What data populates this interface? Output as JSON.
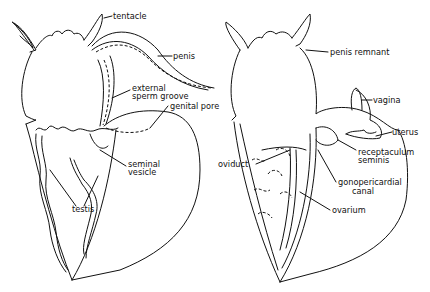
{
  "figure": {
    "left_panel": {
      "title": "male reproductive system",
      "labels": {
        "tentacle": "tentacle",
        "penis": "penis",
        "sperm_groove_line1": "external",
        "sperm_groove_line2": "sperm groove",
        "genital_pore": "genital pore",
        "seminal_vesicle_line1": "seminal",
        "seminal_vesicle_line2": "vesicle",
        "testis": "testis"
      }
    },
    "right_panel": {
      "title": "female reproductive system",
      "labels": {
        "penis_remnant": "penis remnant",
        "vagina": "vagina",
        "uterus": "uterus",
        "receptaculum_line1": "receptaculum",
        "receptaculum_line2": "seminis",
        "oviduct": "oviduct",
        "gonopericardial_line1": "gonopericardial",
        "gonopericardial_line2": "canal",
        "ovarium": "ovarium"
      }
    },
    "colors": {
      "ink": "#111111",
      "background": "#ffffff"
    }
  }
}
